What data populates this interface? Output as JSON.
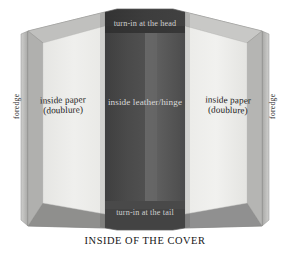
{
  "figure": {
    "caption": "INSIDE OF THE COVER",
    "labels": {
      "head": "turn-in at the head",
      "tail": "turn-in at the tail",
      "hinge": "inside leather/hinge",
      "left_panel_line1": "inside paper",
      "left_panel_line2": "(doublure)",
      "right_panel_line1": "inside paper",
      "right_panel_line2": "(doublure)",
      "foredge_left": "foredge",
      "foredge_right": "foredge"
    },
    "colors": {
      "background": "#ffffff",
      "paper_doublure": "#eeeeec",
      "leather_hinge_dark": "#454545",
      "leather_hinge_mid": "#4f4f4f",
      "leather_hinge_light": "#6a6a6a",
      "turn_in_head": "#3b3b3b",
      "board_frame": "#9b9b9b",
      "board_bevel_light": "#c2c2c2",
      "board_bevel_dark": "#8a8a8a",
      "foredge_edge": "#bdbdbd",
      "label_text_dark": "#1b1b1b",
      "label_text_light": "#d9d9d9"
    }
  }
}
